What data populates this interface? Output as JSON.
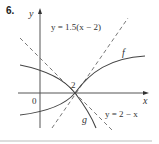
{
  "problem_number": "6.",
  "axes": {
    "x_label": "x",
    "y_label": "y",
    "origin_label": "0"
  },
  "point_label": "2",
  "curves": [
    {
      "name": "f",
      "label": "f",
      "style": "solid"
    },
    {
      "name": "g",
      "label": "g",
      "style": "solid"
    }
  ],
  "tangent_lines": [
    {
      "equation": "y = 1.5(x − 2)",
      "style": "dashed"
    },
    {
      "equation": "y = 2 − x",
      "style": "dashed"
    }
  ],
  "colors": {
    "curve": "#444444",
    "axis": "#555555",
    "dashed": "#777777",
    "divider": "#bbbbbb"
  }
}
